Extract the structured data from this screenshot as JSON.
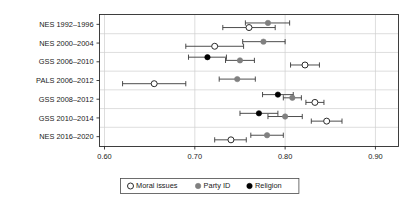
{
  "chart_data": {
    "type": "scatter",
    "title": "",
    "subtitle": "",
    "xlabel": "",
    "ylabel": "",
    "xlim": [
      0.595,
      0.925
    ],
    "xticks": [
      0.6,
      0.7,
      0.8,
      0.9
    ],
    "xtick_labels": [
      "0.60",
      "0.70",
      "0.80",
      "0.90"
    ],
    "grid": true,
    "grid_axis": "x",
    "legend_position": "bottom",
    "orientation": "horizontal",
    "categories": [
      "NES 1992–1996",
      "NES 2000–2004",
      "GSS 2006–2010",
      "PALS 2006–2012",
      "GSS 2008–2012",
      "GSS 2010–2014",
      "NES 2016–2020"
    ],
    "series": [
      {
        "name": "Moral issues",
        "marker": "open-circle",
        "color": "#ffffff",
        "edge_color": "#2b2b2b",
        "values": [
          0.76,
          0.722,
          0.822,
          0.655,
          0.833,
          0.846,
          0.74
        ],
        "ci_low": [
          0.731,
          0.69,
          0.806,
          0.62,
          0.823,
          0.829,
          0.722
        ],
        "ci_high": [
          0.789,
          0.754,
          0.838,
          0.69,
          0.843,
          0.863,
          0.757
        ]
      },
      {
        "name": "Party ID",
        "marker": "filled-circle",
        "color": "#808080",
        "edge_color": "#808080",
        "values": [
          0.781,
          0.776,
          0.75,
          0.747,
          0.808,
          0.8,
          0.78
        ],
        "ci_low": [
          0.756,
          0.753,
          0.734,
          0.727,
          0.798,
          0.781,
          0.762
        ],
        "ci_high": [
          0.805,
          0.8,
          0.766,
          0.767,
          0.818,
          0.819,
          0.798
        ]
      },
      {
        "name": "Religion",
        "marker": "filled-circle",
        "color": "#000000",
        "edge_color": "#000000",
        "values": [
          null,
          null,
          0.714,
          null,
          0.792,
          0.771,
          null
        ],
        "ci_low": [
          null,
          null,
          0.693,
          null,
          0.775,
          0.75,
          null
        ],
        "ci_high": [
          null,
          null,
          0.735,
          null,
          0.809,
          0.792,
          null
        ]
      }
    ]
  },
  "legend": {
    "entries": [
      {
        "label": "Moral issues",
        "marker": "open-circle",
        "color": "#ffffff",
        "edge_color": "#2b2b2b"
      },
      {
        "label": "Party ID",
        "marker": "filled-circle",
        "color": "#808080",
        "edge_color": "#808080"
      },
      {
        "label": "Religion",
        "marker": "filled-circle",
        "color": "#000000",
        "edge_color": "#000000"
      }
    ]
  },
  "colors": {
    "axis": "#2b2b2b",
    "grid": "#cfcfcf",
    "error_bar": "#3a3a3a",
    "background": "#ffffff"
  }
}
